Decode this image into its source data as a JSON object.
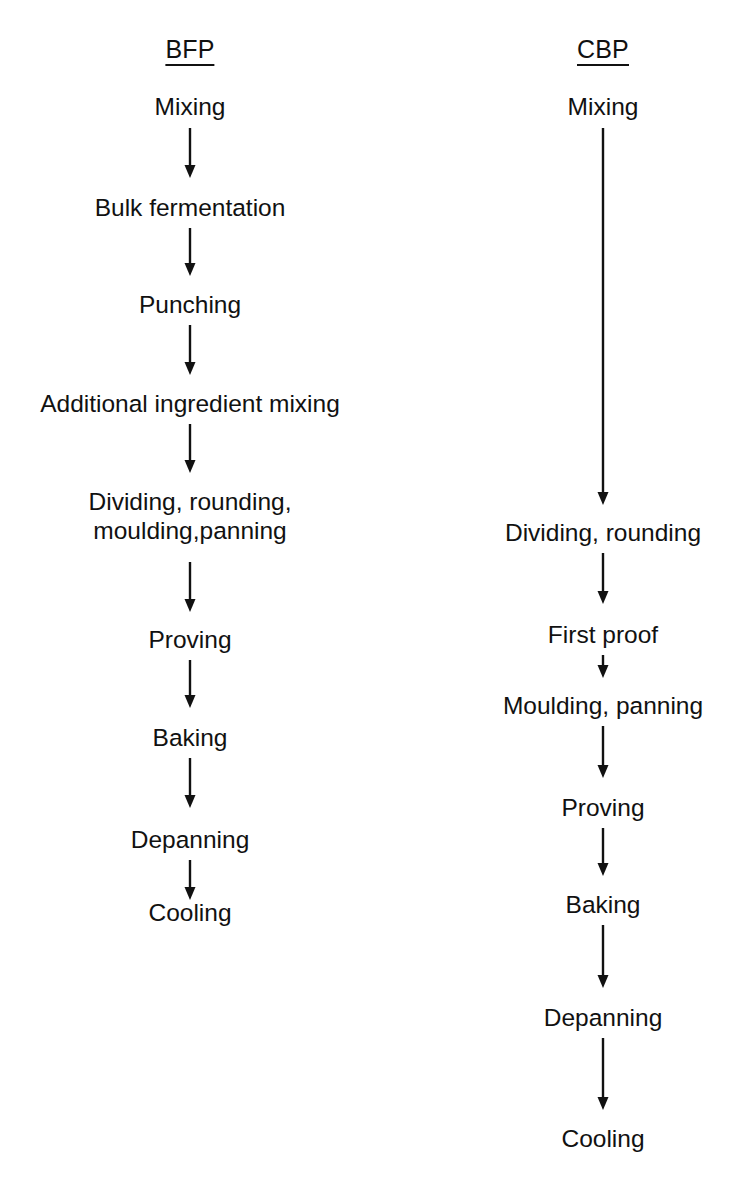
{
  "diagram": {
    "title_alt": "Comparison of bread-making process flows",
    "background_color": "#ffffff",
    "line_color": "#111111",
    "text_color": "#111111"
  },
  "columns": [
    {
      "id": "bfp",
      "header": "BFP",
      "header_underlined": true,
      "center_x": 190,
      "header_y": 37,
      "steps": [
        {
          "label": "Mixing",
          "y": 92,
          "lines": 1
        },
        {
          "label": "Bulk fermentation",
          "y": 193,
          "lines": 1
        },
        {
          "label": "Punching",
          "y": 290,
          "lines": 1
        },
        {
          "label": "Additional ingredient mixing",
          "y": 389,
          "lines": 1
        },
        {
          "label": "Dividing, rounding,\nmoulding,panning",
          "y": 487,
          "lines": 2
        },
        {
          "label": "Proving",
          "y": 625,
          "lines": 1
        },
        {
          "label": "Baking",
          "y": 723,
          "lines": 1
        },
        {
          "label": "Depanning",
          "y": 825,
          "lines": 1
        },
        {
          "label": "Cooling",
          "y": 898,
          "lines": 1
        }
      ],
      "arrows": [
        {
          "from": "Mixing",
          "to": "Bulk fermentation",
          "y1": 128,
          "y2": 178
        },
        {
          "from": "Bulk fermentation",
          "to": "Punching",
          "y1": 228,
          "y2": 276
        },
        {
          "from": "Punching",
          "to": "Additional ingredient mixing",
          "y1": 325,
          "y2": 375
        },
        {
          "from": "Additional ingredient mixing",
          "to": "Dividing, rounding, moulding,panning",
          "y1": 424,
          "y2": 473
        },
        {
          "from": "Dividing, rounding, moulding,panning",
          "to": "Proving",
          "y1": 562,
          "y2": 612
        },
        {
          "from": "Proving",
          "to": "Baking",
          "y1": 660,
          "y2": 708
        },
        {
          "from": "Baking",
          "to": "Depanning",
          "y1": 758,
          "y2": 808
        },
        {
          "from": "Depanning",
          "to": "Cooling",
          "y1": 860,
          "y2": 900
        }
      ]
    },
    {
      "id": "cbp",
      "header": "CBP",
      "header_underlined": true,
      "center_x": 603,
      "header_y": 37,
      "steps": [
        {
          "label": "Mixing",
          "y": 92,
          "lines": 1
        },
        {
          "label": "Dividing, rounding",
          "y": 518,
          "lines": 1
        },
        {
          "label": "First proof",
          "y": 620,
          "lines": 1
        },
        {
          "label": "Moulding, panning",
          "y": 691,
          "lines": 1
        },
        {
          "label": "Proving",
          "y": 793,
          "lines": 1
        },
        {
          "label": "Baking",
          "y": 890,
          "lines": 1
        },
        {
          "label": "Depanning",
          "y": 1003,
          "lines": 1
        },
        {
          "label": "Cooling",
          "y": 1124,
          "lines": 1
        }
      ],
      "arrows": [
        {
          "from": "Mixing",
          "to": "Dividing, rounding",
          "y1": 128,
          "y2": 505
        },
        {
          "from": "Dividing, rounding",
          "to": "First proof",
          "y1": 553,
          "y2": 604
        },
        {
          "from": "First proof",
          "to": "Moulding, panning",
          "y1": 655,
          "y2": 678
        },
        {
          "from": "Moulding, panning",
          "to": "Proving",
          "y1": 726,
          "y2": 778
        },
        {
          "from": "Proving",
          "to": "Baking",
          "y1": 828,
          "y2": 876
        },
        {
          "from": "Baking",
          "to": "Depanning",
          "y1": 925,
          "y2": 988
        },
        {
          "from": "Depanning",
          "to": "Cooling",
          "y1": 1038,
          "y2": 1110
        }
      ]
    }
  ]
}
